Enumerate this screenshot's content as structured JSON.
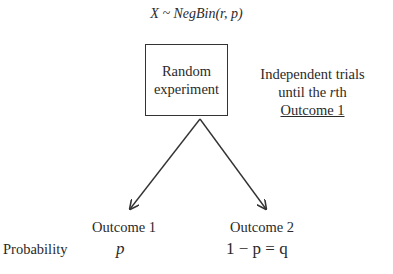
{
  "title": "X ~ NegBin(r, p)",
  "experiment_box": {
    "line1": "Random",
    "line2": "experiment"
  },
  "note": {
    "line1": "Independent trials",
    "line2_pre": "until the ",
    "line2_var": "r",
    "line2_post": "th",
    "line3": "Outcome 1"
  },
  "outcomes": [
    {
      "label": "Outcome 1",
      "probability": "p"
    },
    {
      "label": "Outcome 2",
      "probability": "1 − p = q"
    }
  ],
  "row_label": "Probability"
}
